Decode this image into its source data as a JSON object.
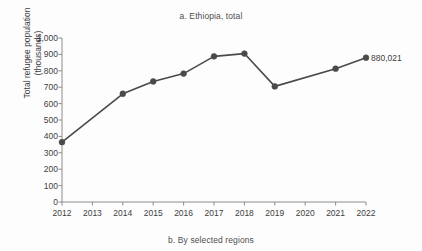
{
  "figure": {
    "title": "a. Ethiopia, total",
    "caption": "b. By selected regions"
  },
  "chart_data": {
    "type": "line",
    "title": "a. Ethiopia, total",
    "xlabel": "",
    "ylabel": "Total refugee population (thousands)",
    "ylabel_line1": "Total refugee population",
    "ylabel_line2": "(thousands)",
    "categories": [
      "2012",
      "2013",
      "2014",
      "2015",
      "2016",
      "2017",
      "2018",
      "2019",
      "2020",
      "2021",
      "2022"
    ],
    "x": [
      2012,
      2013,
      2014,
      2015,
      2016,
      2017,
      2018,
      2019,
      2020,
      2021,
      2022
    ],
    "values": [
      365,
      null,
      660,
      735,
      783,
      888,
      905,
      705,
      null,
      813,
      880
    ],
    "markers": [
      true,
      false,
      true,
      true,
      true,
      true,
      true,
      true,
      false,
      true,
      true
    ],
    "ylim": [
      0,
      1000
    ],
    "ytick_values": [
      0,
      100,
      200,
      300,
      400,
      500,
      600,
      700,
      800,
      900,
      1000
    ],
    "ytick_labels": [
      "0",
      "100",
      "200",
      "300",
      "400",
      "500",
      "600",
      "700",
      "800",
      "900",
      "1,000"
    ],
    "xlim": [
      2012,
      2022
    ],
    "grid": false,
    "legend": "none",
    "series_color": "#4a4a4a",
    "annotations": [
      {
        "text": "880,021",
        "x": 2022,
        "y": 880
      }
    ]
  }
}
